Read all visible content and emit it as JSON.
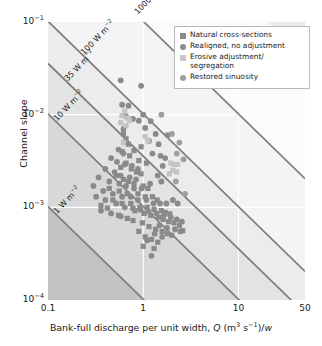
{
  "chart_data": {
    "type": "scatter",
    "title": "",
    "xlabel": "Bank-full discharge per unit width, Q (m3 s-1)/w",
    "ylabel": "Channel slope",
    "xscale": "log",
    "yscale": "log",
    "xlim": [
      0.1,
      50
    ],
    "ylim": [
      0.0001,
      0.1
    ],
    "xticks": [
      "0.1",
      "1",
      "10",
      "50"
    ],
    "xtick_values": [
      0.1,
      1,
      10,
      50
    ],
    "yticks": [
      "10-1",
      "10-2",
      "10-3",
      "10-4"
    ],
    "ytick_values": [
      0.1,
      0.01,
      0.001,
      0.0001
    ],
    "grid": true,
    "legend_position": "top-right",
    "annotations": [
      {
        "text": "1000 W m-2",
        "value": 1000,
        "label": "1000 W m"
      },
      {
        "text": "100 W m-2",
        "value": 100,
        "label": "100 W m"
      },
      {
        "text": "35 W m-2",
        "value": 35,
        "label": "35 W m"
      },
      {
        "text": "10 W m-2",
        "value": 10,
        "label": "10 W m"
      },
      {
        "text": "1 W m-2",
        "value": 1,
        "label": "1 W m"
      }
    ],
    "power_lines": [
      1000,
      100,
      35,
      10,
      1
    ],
    "series": [
      {
        "name": "Natural cross-sections",
        "marker": "square",
        "color": "#8a8a8a",
        "points": [
          [
            0.62,
            0.0062
          ],
          [
            0.66,
            0.0055
          ],
          [
            0.7,
            0.0048
          ],
          [
            0.6,
            0.004
          ],
          [
            0.72,
            0.0036
          ],
          [
            0.8,
            0.0041
          ],
          [
            0.9,
            0.0032
          ],
          [
            0.66,
            0.003
          ],
          [
            0.58,
            0.0027
          ],
          [
            0.75,
            0.0026
          ],
          [
            0.85,
            0.0024
          ],
          [
            0.95,
            0.0023
          ],
          [
            0.52,
            0.0022
          ],
          [
            0.62,
            0.002
          ],
          [
            0.7,
            0.0019
          ],
          [
            0.8,
            0.0018
          ],
          [
            1.0,
            0.0017
          ],
          [
            1.12,
            0.0016
          ],
          [
            0.44,
            0.0016
          ],
          [
            0.56,
            0.0015
          ],
          [
            0.68,
            0.0014
          ],
          [
            0.88,
            0.0014
          ],
          [
            1.05,
            0.0013
          ],
          [
            1.25,
            0.0013
          ],
          [
            1.4,
            0.0012
          ],
          [
            0.48,
            0.0012
          ],
          [
            0.6,
            0.0011
          ],
          [
            0.74,
            0.0011
          ],
          [
            0.92,
            0.001
          ],
          [
            1.1,
            0.001
          ],
          [
            1.3,
            0.00095
          ],
          [
            1.55,
            0.00092
          ],
          [
            1.7,
            0.00088
          ],
          [
            1.9,
            0.00085
          ],
          [
            0.36,
            0.00105
          ],
          [
            0.42,
            0.00098
          ],
          [
            0.82,
            0.00092
          ],
          [
            1.02,
            0.00086
          ],
          [
            1.2,
            0.00082
          ],
          [
            1.45,
            0.00078
          ],
          [
            1.62,
            0.00074
          ],
          [
            1.85,
            0.0007
          ],
          [
            2.1,
            0.00068
          ],
          [
            2.4,
            0.00064
          ],
          [
            0.55,
            0.00082
          ],
          [
            0.68,
            0.00076
          ],
          [
            0.78,
            0.00072
          ],
          [
            0.98,
            0.00068
          ],
          [
            1.15,
            0.00062
          ],
          [
            1.35,
            0.00058
          ],
          [
            1.58,
            0.00055
          ],
          [
            1.8,
            0.00052
          ],
          [
            2.0,
            0.0005
          ],
          [
            2.6,
            0.00056
          ],
          [
            0.9,
            0.00055
          ],
          [
            1.05,
            0.00048
          ],
          [
            1.22,
            0.00045
          ],
          [
            1.42,
            0.00042
          ],
          [
            1.0,
            0.00038
          ],
          [
            1.3,
            0.00036
          ],
          [
            0.95,
            0.0045
          ],
          [
            1.08,
            0.003
          ]
        ]
      },
      {
        "name": "Realigned, no adjustment",
        "marker": "circle",
        "color": "#8a8a8a",
        "points": [
          [
            0.58,
            0.0235
          ],
          [
            0.95,
            0.0205
          ],
          [
            0.6,
            0.0128
          ],
          [
            0.7,
            0.0125
          ],
          [
            1.0,
            0.01
          ],
          [
            0.66,
            0.0096
          ],
          [
            0.78,
            0.009
          ],
          [
            0.9,
            0.0086
          ],
          [
            1.2,
            0.0085
          ],
          [
            1.05,
            0.0072
          ],
          [
            0.62,
            0.007
          ],
          [
            1.35,
            0.0062
          ],
          [
            1.8,
            0.006
          ],
          [
            1.15,
            0.0052
          ],
          [
            1.45,
            0.0048
          ],
          [
            0.55,
            0.0042
          ],
          [
            0.62,
            0.0038
          ],
          [
            1.25,
            0.0038
          ],
          [
            1.52,
            0.0036
          ],
          [
            1.7,
            0.0034
          ],
          [
            0.46,
            0.0034
          ],
          [
            0.53,
            0.0031
          ],
          [
            0.64,
            0.0029
          ],
          [
            0.76,
            0.0028
          ],
          [
            0.88,
            0.0026
          ],
          [
            1.6,
            0.0028
          ],
          [
            0.4,
            0.0026
          ],
          [
            0.5,
            0.0024
          ],
          [
            0.58,
            0.0022
          ],
          [
            0.72,
            0.0021
          ],
          [
            0.84,
            0.002
          ],
          [
            1.42,
            0.0022
          ],
          [
            0.34,
            0.0021
          ],
          [
            0.44,
            0.0019
          ],
          [
            0.56,
            0.0018
          ],
          [
            0.66,
            0.0017
          ],
          [
            0.8,
            0.0016
          ],
          [
            0.96,
            0.0016
          ],
          [
            1.18,
            0.0018
          ],
          [
            1.55,
            0.0019
          ],
          [
            0.3,
            0.0017
          ],
          [
            0.38,
            0.0015
          ],
          [
            0.48,
            0.0014
          ],
          [
            0.6,
            0.0013
          ],
          [
            0.74,
            0.0013
          ],
          [
            0.88,
            0.0012
          ],
          [
            1.08,
            0.0012
          ],
          [
            1.28,
            0.0011
          ],
          [
            1.5,
            0.0011
          ],
          [
            1.75,
            0.0011
          ],
          [
            2.05,
            0.0012
          ],
          [
            2.3,
            0.0011
          ],
          [
            0.32,
            0.0013
          ],
          [
            0.4,
            0.0012
          ],
          [
            0.52,
            0.0011
          ],
          [
            0.64,
            0.001
          ],
          [
            0.78,
            0.00098
          ],
          [
            0.94,
            0.00094
          ],
          [
            1.14,
            0.0009
          ],
          [
            1.38,
            0.00086
          ],
          [
            1.65,
            0.00082
          ],
          [
            1.95,
            0.00078
          ],
          [
            2.25,
            0.00074
          ],
          [
            2.55,
            0.0007
          ],
          [
            0.36,
            0.00092
          ],
          [
            0.46,
            0.00086
          ],
          [
            0.58,
            0.0008
          ],
          [
            1.48,
            0.00064
          ],
          [
            1.78,
            0.0006
          ],
          [
            2.15,
            0.00058
          ],
          [
            2.45,
            0.00055
          ],
          [
            1.32,
            0.00052
          ],
          [
            1.58,
            0.00048
          ],
          [
            1.1,
            0.00044
          ],
          [
            1.22,
            0.0003
          ]
        ]
      },
      {
        "name": "Erosive adjustment/ segregation",
        "marker": "square",
        "color": "#c4c4c4",
        "points": [
          [
            0.64,
            0.011
          ],
          [
            0.6,
            0.0098
          ],
          [
            0.68,
            0.0092
          ],
          [
            0.72,
            0.0086
          ],
          [
            0.58,
            0.0082
          ],
          [
            0.66,
            0.0076
          ],
          [
            1.05,
            0.0058
          ],
          [
            1.12,
            0.0052
          ],
          [
            1.95,
            0.003
          ],
          [
            2.1,
            0.0029
          ],
          [
            2.3,
            0.0029
          ],
          [
            2.05,
            0.0025
          ],
          [
            2.25,
            0.0024
          ],
          [
            1.88,
            0.0023
          ],
          [
            0.62,
            0.005
          ]
        ]
      },
      {
        "name": "Restored sinuosity",
        "marker": "circle",
        "color": "#9e9e9e",
        "points": [
          [
            1.55,
            0.01
          ],
          [
            2.0,
            0.0062
          ],
          [
            2.4,
            0.005
          ],
          [
            2.25,
            0.0038
          ],
          [
            2.65,
            0.0033
          ],
          [
            2.2,
            0.0019
          ],
          [
            2.75,
            0.0014
          ]
        ]
      }
    ]
  },
  "axes": {
    "ylabel": "Channel slope",
    "xlabel_parts": {
      "lead": "Bank-full discharge per unit width, ",
      "q": "Q",
      "units_open": " (m",
      "units_m_exp": "3",
      "units_s": " s",
      "units_s_exp": "−1",
      "units_close": ")/",
      "w": "w"
    },
    "yticks": [
      {
        "base": "10",
        "exp": "−1"
      },
      {
        "base": "10",
        "exp": "−2"
      },
      {
        "base": "10",
        "exp": "−3"
      },
      {
        "base": "10",
        "exp": "−4"
      }
    ],
    "xticks": [
      "0.1",
      "1",
      "10",
      "50"
    ]
  },
  "line_labels": [
    {
      "base": "1000 W m",
      "exp": "−2"
    },
    {
      "base": "100 W m",
      "exp": "−2"
    },
    {
      "base": "35 W m",
      "exp": "−2"
    },
    {
      "base": "10 W m",
      "exp": "−2"
    },
    {
      "base": "1 W m",
      "exp": "−2"
    }
  ],
  "legend": {
    "items": [
      {
        "label": "Natural cross-sections",
        "marker": "square",
        "color": "#8a8a8a"
      },
      {
        "label": "Realigned, no adjustment",
        "marker": "circle",
        "color": "#8a8a8a"
      },
      {
        "label": "Erosive adjustment/",
        "label2": "segregation",
        "marker": "square",
        "color": "#c6c6c6"
      },
      {
        "label": "Restored sinuosity",
        "marker": "circle",
        "color": "#9e9e9e"
      }
    ]
  },
  "colors": {
    "band_darkest": "#c2c2c2",
    "band_dark": "#d8d8d8",
    "band_mid": "#e3e3e3",
    "band_light": "#ececec",
    "band_lightest": "#f4f4f4",
    "line": "#7d7d7d",
    "grid": "#ffffff",
    "text": "#1a1a1a"
  }
}
